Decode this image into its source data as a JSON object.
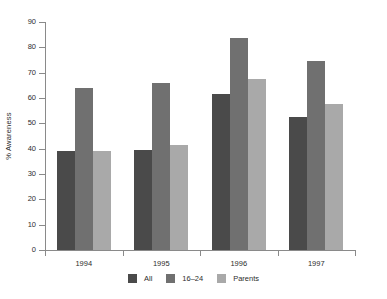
{
  "chart_data": {
    "type": "bar",
    "title": "",
    "subtitle": "",
    "xlabel": "",
    "ylabel": "% Awareness",
    "categories": [
      "1994",
      "1995",
      "1996",
      "1997"
    ],
    "series": [
      {
        "name": "All",
        "color": "#4a4a4a",
        "values": [
          39.0,
          39.5,
          61.5,
          52.5
        ]
      },
      {
        "name": "16–24",
        "color": "#707070",
        "values": [
          64.0,
          66.0,
          83.5,
          74.5
        ]
      },
      {
        "name": "Parents",
        "color": "#a9a9a9",
        "values": [
          39.0,
          41.5,
          67.5,
          57.5
        ]
      }
    ],
    "ylim": [
      0,
      90
    ],
    "yticks": [
      0,
      10,
      20,
      30,
      40,
      50,
      60,
      70,
      80,
      90
    ],
    "ytick_labels": [
      "0",
      "10",
      "20",
      "30",
      "40",
      "50",
      "60",
      "70",
      "80",
      "90"
    ],
    "grid": false,
    "legend_position": "bottom-center",
    "legend_entries": [
      "All",
      "16–24",
      "Parents"
    ],
    "annotations": []
  },
  "axes": {
    "y_axis_title": "% Awareness",
    "axis_color": "#8a8a8a",
    "tick_label_color": "#2d2d2d"
  },
  "legend": {
    "items": [
      {
        "label": "All",
        "color": "#4a4a4a"
      },
      {
        "label": "16–24",
        "color": "#707070"
      },
      {
        "label": "Parents",
        "color": "#a9a9a9"
      }
    ]
  },
  "background": "#ffffff"
}
